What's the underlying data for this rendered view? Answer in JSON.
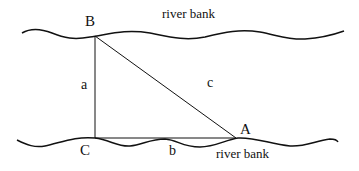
{
  "diagram": {
    "type": "right-triangle-river-crossing",
    "banks": {
      "top_label": "river bank",
      "bottom_label": "river bank"
    },
    "vertices": {
      "A": "A",
      "B": "B",
      "C": "C"
    },
    "sides": {
      "a": "a",
      "b": "b",
      "c": "c"
    },
    "colors": {
      "stroke": "#111111",
      "background": "#ffffff"
    }
  }
}
